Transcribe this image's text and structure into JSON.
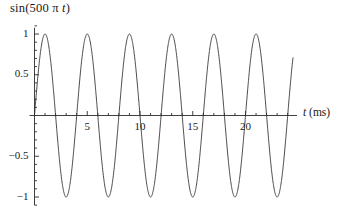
{
  "chart_data": {
    "type": "line",
    "title": "sin(500 π t)",
    "title_parts": {
      "prefix": "sin(500 π ",
      "italic": "t",
      "suffix": ")"
    },
    "xlabel": "t (ms)",
    "xlabel_parts": {
      "italic": "t",
      "rest": " (ms)"
    },
    "ylabel": "",
    "function": "sin(500*pi*t)",
    "xunits": "ms",
    "xlim": [
      0,
      24.5
    ],
    "ylim": [
      -1.15,
      1.15
    ],
    "period_ms": 4,
    "amplitude": 1,
    "grid": false,
    "legend": null,
    "line_color": "#2b2b2b",
    "axis_color": "#2b2b2b",
    "xticks": [
      5,
      10,
      15,
      20
    ],
    "xtick_labels": [
      "5",
      "10",
      "15",
      "20"
    ],
    "x_minor_tick_step": 1,
    "yticks": [
      -1,
      -0.5,
      0.5,
      1
    ],
    "ytick_labels": [
      "-1",
      "-0.5",
      "0.5",
      "1"
    ],
    "y_minor_tick_step": 0.1,
    "peaks_ms": [
      1,
      5,
      9,
      13,
      17,
      21
    ],
    "peak_value": 1,
    "troughs_ms": [
      3,
      7,
      11,
      15,
      19,
      23
    ],
    "trough_value": -1,
    "zero_crossings_ms": [
      0,
      2,
      4,
      6,
      8,
      10,
      12,
      14,
      16,
      18,
      20,
      22,
      24
    ],
    "x": [
      0,
      0.5,
      1,
      1.5,
      2,
      2.5,
      3,
      3.5,
      4,
      4.5,
      5,
      5.5,
      6,
      6.5,
      7,
      7.5,
      8,
      8.5,
      9,
      9.5,
      10,
      10.5,
      11,
      11.5,
      12,
      12.5,
      13,
      13.5,
      14,
      14.5,
      15,
      15.5,
      16,
      16.5,
      17,
      17.5,
      18,
      18.5,
      19,
      19.5,
      20,
      20.5,
      21,
      21.5,
      22,
      22.5,
      23,
      23.5,
      24
    ],
    "y": [
      0,
      0.707,
      1,
      0.707,
      0,
      -0.707,
      -1,
      -0.707,
      0,
      0.707,
      1,
      0.707,
      0,
      -0.707,
      -1,
      -0.707,
      0,
      0.707,
      1,
      0.707,
      0,
      -0.707,
      -1,
      -0.707,
      0,
      0.707,
      1,
      0.707,
      0,
      -0.707,
      -1,
      -0.707,
      0,
      0.707,
      1,
      0.707,
      0,
      -0.707,
      -1,
      -0.707,
      0,
      0.707,
      1,
      0.707,
      0,
      -0.707,
      -1,
      -0.707,
      0
    ]
  }
}
